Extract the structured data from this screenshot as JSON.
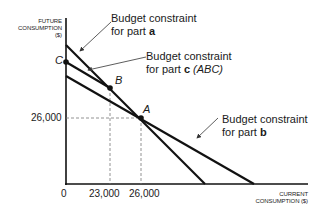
{
  "diagram": {
    "y_axis_title": [
      "FUTURE",
      "CONSUMPTION",
      "($)"
    ],
    "x_axis_title": [
      "CURRENT",
      "CONSUMPTION ($)"
    ],
    "origin_label": "0",
    "y_tick": "26,000",
    "x_ticks": [
      "23,000",
      "26,000"
    ],
    "points": {
      "A": "A",
      "B": "B",
      "C": "C"
    },
    "annotations": {
      "part_a": {
        "line1": "Budget constraint",
        "line2_prefix": "for part ",
        "line2_bold": "a"
      },
      "part_c": {
        "line1": "Budget constraint",
        "line2_prefix": "for part ",
        "line2_bold": "c",
        "line2_suffix": " (ABC)"
      },
      "part_b": {
        "line1": "Budget constraint",
        "line2_prefix": "for part ",
        "line2_bold": "b"
      }
    },
    "colors": {
      "line": "#111111",
      "dash": "#777777"
    }
  }
}
